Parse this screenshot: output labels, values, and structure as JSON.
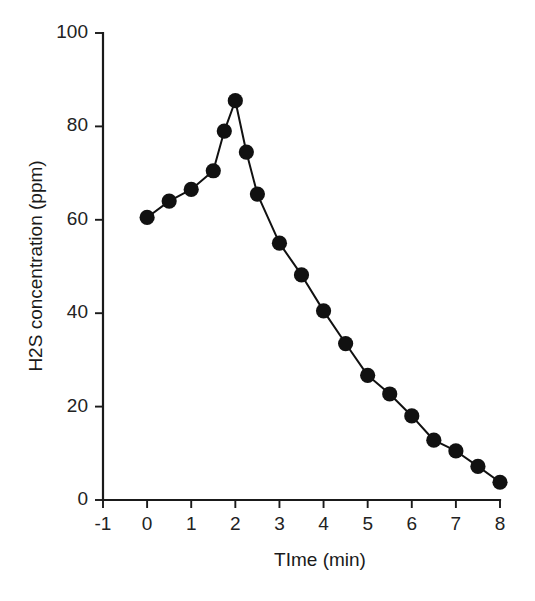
{
  "chart_data": {
    "type": "line",
    "title": "",
    "xlabel": "TIme (min)",
    "ylabel": "H2S concentration (ppm)",
    "xlim": [
      -1,
      8
    ],
    "ylim": [
      0,
      100
    ],
    "xticks": [
      -1,
      0,
      1,
      2,
      3,
      4,
      5,
      6,
      7,
      8
    ],
    "xtick_labels": [
      "-1",
      "0",
      "1",
      "2",
      "3",
      "4",
      "5",
      "6",
      "7",
      "8"
    ],
    "yticks": [
      0,
      20,
      40,
      60,
      80,
      100
    ],
    "ytick_labels": [
      "0",
      "20",
      "40",
      "60",
      "80",
      "100"
    ],
    "grid": false,
    "legend": false,
    "marker": "filled-circle",
    "marker_color": "#111111",
    "line_color": "#111111",
    "x": [
      0,
      0.5,
      1,
      1.5,
      1.75,
      2,
      2.25,
      2.5,
      3,
      3.5,
      4,
      4.5,
      5,
      5.5,
      6,
      6.5,
      7,
      7.5,
      8
    ],
    "y": [
      60.5,
      64.0,
      66.5,
      70.5,
      79.0,
      85.5,
      74.5,
      65.5,
      55.0,
      48.2,
      40.5,
      33.5,
      26.7,
      22.7,
      18.0,
      12.8,
      10.5,
      7.2,
      3.8
    ],
    "series": [
      {
        "name": "H2S concentration",
        "values": [
          60.5,
          64.0,
          66.5,
          70.5,
          79.0,
          85.5,
          74.5,
          65.5,
          55.0,
          48.2,
          40.5,
          33.5,
          26.7,
          22.7,
          18.0,
          12.8,
          10.5,
          7.2,
          3.8
        ]
      }
    ]
  }
}
